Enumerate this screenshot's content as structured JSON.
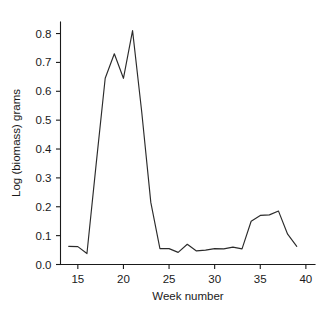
{
  "chart_data": {
    "type": "line",
    "title": "",
    "xlabel": "Week number",
    "ylabel": "Log (biomass) grams",
    "xlim": [
      13.1,
      41.0
    ],
    "ylim": [
      0.0,
      0.84
    ],
    "xticks": [
      15,
      20,
      25,
      30,
      35,
      40
    ],
    "xtick_labels": [
      "15",
      "20",
      "25",
      "30",
      "35",
      "40"
    ],
    "yticks": [
      0.0,
      0.1,
      0.2,
      0.3,
      0.4,
      0.5,
      0.6,
      0.7,
      0.8
    ],
    "ytick_labels": [
      "0.0",
      "0.1",
      "0.2",
      "0.3",
      "0.4",
      "0.5",
      "0.6",
      "0.7",
      "0.8"
    ],
    "grid": false,
    "legend": false,
    "line_color": "#2b2b2b",
    "x": [
      14,
      15,
      16,
      17,
      18,
      19,
      20,
      21,
      22,
      23,
      24,
      25,
      26,
      27,
      28,
      29,
      30,
      31,
      32,
      33,
      34,
      35,
      36,
      37,
      38,
      39
    ],
    "values": [
      0.063,
      0.062,
      0.038,
      0.345,
      0.645,
      0.73,
      0.645,
      0.81,
      0.53,
      0.215,
      0.055,
      0.055,
      0.042,
      0.07,
      0.047,
      0.05,
      0.055,
      0.054,
      0.06,
      0.054,
      0.15,
      0.17,
      0.172,
      0.185,
      0.105,
      0.063
    ],
    "series": [
      {
        "name": "Log (biomass) grams",
        "values": [
          0.063,
          0.062,
          0.038,
          0.345,
          0.645,
          0.73,
          0.645,
          0.81,
          0.53,
          0.215,
          0.055,
          0.055,
          0.042,
          0.07,
          0.047,
          0.05,
          0.055,
          0.054,
          0.06,
          0.054,
          0.15,
          0.17,
          0.172,
          0.185,
          0.105,
          0.063
        ]
      }
    ]
  }
}
